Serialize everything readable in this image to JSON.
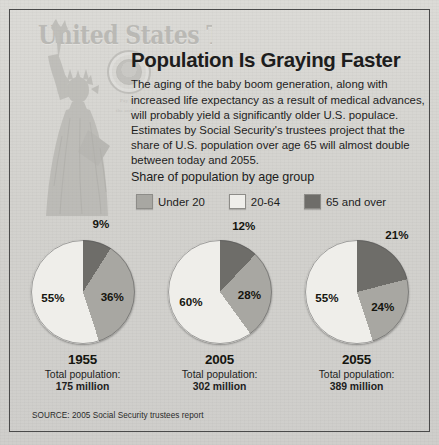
{
  "headline": "Population Is Graying Faster",
  "deck": "The aging of the baby boom generation, along with increased life expectancy as a result of medical advances, will probably yield a significantly older U.S. populace. Estimates by Social Security's trustees project that the share of U.S. population over age 65 will almost double between today and 2055.",
  "legend_title": "Share of population by age group",
  "watermark": {
    "treasury_text": "United States Treasury",
    "micro_line1": "Pay to",
    "micro_line2": "the order"
  },
  "legend": [
    {
      "label": "Under 20",
      "color": "#a8a7a2"
    },
    {
      "label": "20-64",
      "color": "#efeeea"
    },
    {
      "label": "65 and over",
      "color": "#6e6d69"
    }
  ],
  "source": "SOURCE: 2005 Social Security trustees report",
  "chart_data": {
    "type": "pie",
    "title": "Share of population by age group",
    "categories": [
      "Under 20",
      "20-64",
      "65 and over"
    ],
    "colors": [
      "#a8a7a2",
      "#efeeea",
      "#6e6d69"
    ],
    "legend_position": "top",
    "charts": [
      {
        "year": "1955",
        "total_label": "Total population:",
        "total_value": "175 million",
        "values": [
          36,
          55,
          9
        ],
        "labels": [
          "36%",
          "55%",
          "9%"
        ]
      },
      {
        "year": "2005",
        "total_label": "Total population:",
        "total_value": "302 million",
        "values": [
          28,
          60,
          12
        ],
        "labels": [
          "28%",
          "60%",
          "12%"
        ]
      },
      {
        "year": "2055",
        "total_label": "Total population:",
        "total_value": "389 million",
        "values": [
          24,
          55,
          21
        ],
        "labels": [
          "24%",
          "55%",
          "21%"
        ]
      }
    ]
  }
}
